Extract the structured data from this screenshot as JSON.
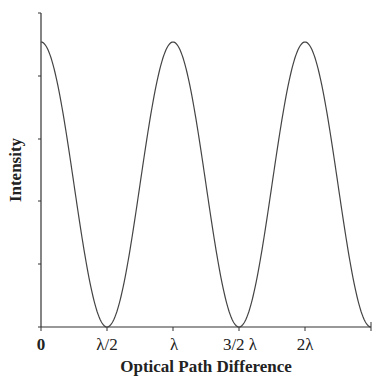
{
  "chart_data": {
    "type": "line",
    "title": "",
    "xlabel": "Optical Path Difference",
    "ylabel": "Intensity",
    "x_ticks": [
      "0",
      "λ/2",
      "λ",
      "3/2 λ",
      "2λ"
    ],
    "x_tick_values_in_lambda": [
      0,
      0.5,
      1.0,
      1.5,
      2.0
    ],
    "y_ticks_count": 6,
    "y_tick_labels": [],
    "xlim_in_lambda": [
      0,
      2.5
    ],
    "ylim": [
      0,
      1.1
    ],
    "grid": false,
    "legend": null,
    "series": [
      {
        "name": "Intensity",
        "function": "I = cos^2(pi * x / lambda)",
        "x": [
          0,
          0.25,
          0.5,
          0.75,
          1.0,
          1.25,
          1.5,
          1.75,
          2.0,
          2.25,
          2.5
        ],
        "values": [
          1.0,
          0.5,
          0.0,
          0.5,
          1.0,
          0.5,
          0.0,
          0.5,
          1.0,
          0.5,
          0.02
        ]
      }
    ],
    "color": "#333333"
  }
}
